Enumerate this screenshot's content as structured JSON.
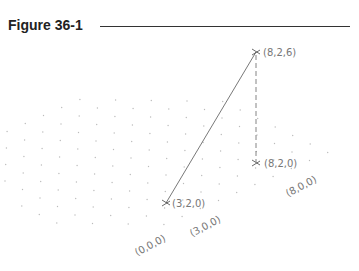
{
  "figure": {
    "title": "Figure 36-1"
  },
  "points": [
    {
      "label": "(8,2,6)",
      "coords": [
        8,
        2,
        6
      ]
    },
    {
      "label": "(8,2,0)",
      "coords": [
        8,
        2,
        0
      ]
    },
    {
      "label": "(3,2,0)",
      "coords": [
        3,
        2,
        0
      ]
    }
  ],
  "axis_labels": [
    {
      "label": "(0,0,0)"
    },
    {
      "label": "(3,0,0)"
    },
    {
      "label": "(8,0,0)"
    }
  ],
  "colors": {
    "line": "#555555",
    "grid_dot": "#bbbbbb",
    "label": "#777777"
  }
}
